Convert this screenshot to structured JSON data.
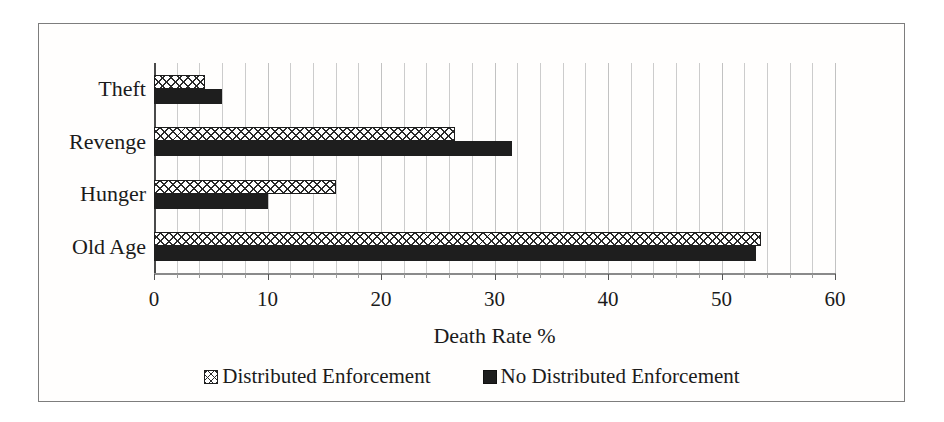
{
  "chart_data": {
    "type": "bar",
    "orientation": "horizontal",
    "categories": [
      "Theft",
      "Revenge",
      "Hunger",
      "Old Age"
    ],
    "series": [
      {
        "name": "Distributed Enforcement",
        "style": "hatched",
        "values": [
          4.5,
          26.5,
          16,
          53.5
        ]
      },
      {
        "name": "No Distributed Enforcement",
        "style": "solid",
        "values": [
          6,
          31.5,
          10,
          53
        ]
      }
    ],
    "title": "",
    "xlabel": "Death Rate %",
    "ylabel": "",
    "xlim": [
      0,
      60
    ],
    "x_ticks": [
      0,
      10,
      20,
      30,
      40,
      50,
      60
    ],
    "minor_gridline_interval": 2,
    "grid": "vertical-minor",
    "legend_position": "bottom",
    "colors": {
      "solid_bar": "#1e1e1e",
      "hatch_line": "#2a2a2a",
      "gridline": "#cccccc",
      "frame_border": "#7d7d7d",
      "text": "#1b1b1b",
      "background": "#ffffff"
    }
  }
}
